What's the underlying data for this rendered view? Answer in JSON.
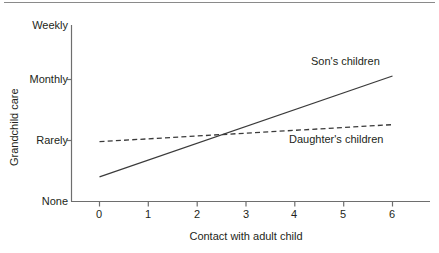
{
  "chart_data": {
    "type": "line",
    "title": "",
    "xlabel": "Contact with adult child",
    "ylabel": "Grandchild care",
    "xlim": [
      0,
      6
    ],
    "ylim": [
      0,
      3
    ],
    "xticks": [
      "0",
      "1",
      "2",
      "3",
      "4",
      "5",
      "6"
    ],
    "xtick_values": [
      0,
      1,
      2,
      3,
      4,
      5,
      6
    ],
    "yticks": [
      "None",
      "Rarely",
      "Monthly",
      "Weekly"
    ],
    "ytick_values": [
      0,
      1,
      2,
      3
    ],
    "grid": false,
    "legend_position": "inline-annotation",
    "series": [
      {
        "name": "Son's children",
        "style": "solid",
        "color": "#3a3a3a",
        "x": [
          0,
          6
        ],
        "values": [
          0.42,
          2.14
        ]
      },
      {
        "name": "Daughter's children",
        "style": "dashed",
        "color": "#3a3a3a",
        "x": [
          0,
          6
        ],
        "values": [
          1.02,
          1.31
        ]
      }
    ],
    "annotations": [
      {
        "text": "Son's children",
        "x": 4.35,
        "y": 2.44
      },
      {
        "text": "Daughter's children",
        "x": 3.9,
        "y": 1.0
      }
    ]
  },
  "axis": {
    "line_color": "#6e6e6e",
    "x_title": "Contact with adult child",
    "y_title": "Grandchild care"
  },
  "ylabels": {
    "weekly": "Weekly",
    "monthly": "Monthly",
    "rarely": "Rarely",
    "none": "None"
  },
  "xlabels": {
    "t0": "0",
    "t1": "1",
    "t2": "2",
    "t3": "3",
    "t4": "4",
    "t5": "5",
    "t6": "6"
  },
  "series_labels": {
    "son": "Son's children",
    "daughter": "Daughter's children"
  }
}
